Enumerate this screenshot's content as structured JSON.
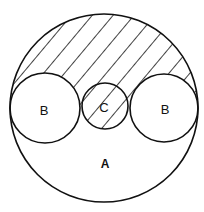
{
  "diagram": {
    "type": "venn-circles",
    "stroke_color": "#111111",
    "background_color": "#ffffff",
    "hatch": {
      "direction": "upper-left to lower-right",
      "region": "inside A, outside both B circles (upper part), including all of C"
    },
    "circles": [
      {
        "id": "A",
        "label": "A",
        "cx": 104,
        "cy": 108,
        "r": 94
      },
      {
        "id": "B_left",
        "label": "B",
        "cx": 45,
        "cy": 108,
        "r": 35
      },
      {
        "id": "C",
        "label": "C",
        "cx": 105,
        "cy": 106,
        "r": 23
      },
      {
        "id": "B_right",
        "label": "B",
        "cx": 164,
        "cy": 108,
        "r": 34
      }
    ]
  },
  "labels": {
    "a": "A",
    "b_left": "B",
    "c": "C",
    "b_right": "B"
  }
}
